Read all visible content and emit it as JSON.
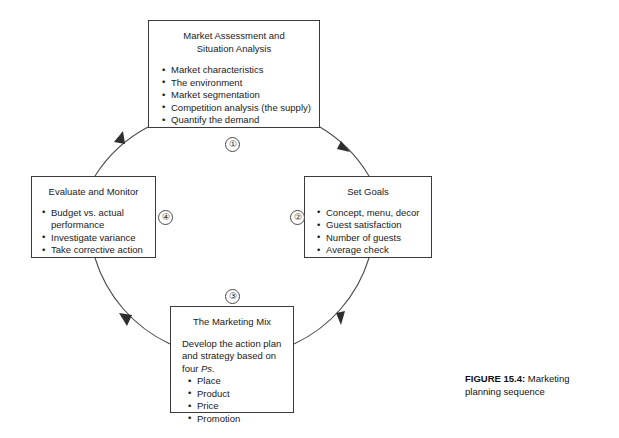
{
  "figure": {
    "caption_label": "FIGURE 15.4:",
    "caption_text": " Marketing planning sequence",
    "colors": {
      "background": "#ffffff",
      "stroke": "#3a3a3a",
      "text": "#1a1a1a",
      "arc": "#4a4a4a"
    }
  },
  "steps": [
    {
      "marker": "①",
      "number": "1"
    },
    {
      "marker": "②",
      "number": "2"
    },
    {
      "marker": "③",
      "number": "3"
    },
    {
      "marker": "④",
      "number": "4"
    }
  ],
  "nodes": {
    "market_assessment": {
      "title": "Market Assessment and\nSituation Analysis",
      "bullets": [
        "Market characteristics",
        "The environment",
        "Market segmentation",
        "Competition analysis (the supply)",
        "Quantify the demand"
      ]
    },
    "set_goals": {
      "title": "Set Goals",
      "bullets": [
        "Concept, menu, decor",
        "Guest satisfaction",
        "Number of guests",
        "Average check"
      ]
    },
    "marketing_mix": {
      "title": "The Marketing Mix",
      "intro_before": "Develop the action plan and strategy based on four ",
      "intro_italic": "Ps",
      "intro_after": ".",
      "bullets": [
        "Place",
        "Product",
        "Price",
        "Promotion"
      ]
    },
    "evaluate_monitor": {
      "title": "Evaluate and Monitor",
      "bullets": [
        "Budget vs. actual performance",
        "Investigate variance",
        "Take corrective action"
      ]
    }
  }
}
